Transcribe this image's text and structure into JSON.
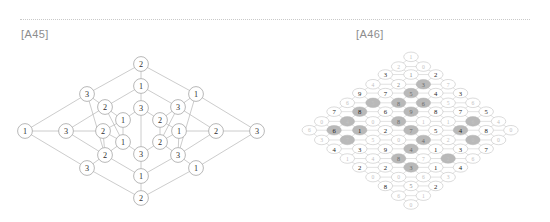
{
  "page": {
    "background": "#ffffff",
    "width": 550,
    "height": 222,
    "rule_style": "dotted",
    "rule_color": "#c9c9c9"
  },
  "captions": {
    "left": "[A45]",
    "right": "[A46]",
    "color": "#8d8d8d"
  },
  "figures": [
    {
      "id": "A45",
      "caption": "[A45]",
      "type": "node-link-diagram",
      "description": "sparse diamond lattice of circled digits",
      "node_fill": "#ffffff",
      "node_stroke": "#9a9a9a",
      "edge_color": "#b0b0b0",
      "node_count": 29,
      "value_set": [
        1,
        2,
        3
      ],
      "nodes": [
        {
          "id": "n0",
          "x": 131,
          "y": 14,
          "label": "2"
        },
        {
          "id": "n1",
          "x": 131,
          "y": 36,
          "label": "1"
        },
        {
          "id": "n2",
          "x": 131,
          "y": 58,
          "label": "3"
        },
        {
          "id": "n3",
          "x": 131,
          "y": 104,
          "label": "3"
        },
        {
          "id": "n4",
          "x": 131,
          "y": 126,
          "label": "1"
        },
        {
          "id": "n5",
          "x": 131,
          "y": 148,
          "label": "2"
        },
        {
          "id": "n6",
          "x": 77,
          "y": 44,
          "label": "3"
        },
        {
          "id": "n7",
          "x": 95,
          "y": 57,
          "label": "2"
        },
        {
          "id": "n8",
          "x": 113,
          "y": 70,
          "label": "1"
        },
        {
          "id": "n9",
          "x": 186,
          "y": 44,
          "label": "1"
        },
        {
          "id": "n10",
          "x": 168,
          "y": 57,
          "label": "3"
        },
        {
          "id": "n11",
          "x": 150,
          "y": 70,
          "label": "2"
        },
        {
          "id": "n12",
          "x": 77,
          "y": 118,
          "label": "3"
        },
        {
          "id": "n13",
          "x": 95,
          "y": 105,
          "label": "2"
        },
        {
          "id": "n14",
          "x": 113,
          "y": 92,
          "label": "1"
        },
        {
          "id": "n15",
          "x": 186,
          "y": 118,
          "label": "1"
        },
        {
          "id": "n16",
          "x": 168,
          "y": 105,
          "label": "3"
        },
        {
          "id": "n17",
          "x": 150,
          "y": 92,
          "label": "2"
        },
        {
          "id": "n18",
          "x": 15,
          "y": 81,
          "label": "1"
        },
        {
          "id": "n19",
          "x": 56,
          "y": 81,
          "label": "3"
        },
        {
          "id": "n20",
          "x": 93,
          "y": 81,
          "label": "2"
        },
        {
          "id": "n21",
          "x": 169,
          "y": 81,
          "label": "1"
        },
        {
          "id": "n22",
          "x": 206,
          "y": 81,
          "label": "2"
        },
        {
          "id": "n23",
          "x": 247,
          "y": 81,
          "label": "3"
        }
      ]
    },
    {
      "id": "A46",
      "caption": "[A46]",
      "type": "node-link-diagram",
      "description": "dense diamond lattice of circled digits 0-9 with shaded diagonal cells",
      "cell_fill_plain": "#ffffff",
      "cell_fill_shaded": "#b9b9b9",
      "cell_stroke": "#b5b5b5",
      "edge_color": "#bdbdbd",
      "value_set": [
        0,
        1,
        2,
        3,
        4,
        5,
        6,
        7,
        8,
        9
      ],
      "rows": [
        {
          "y": 10,
          "cells": [
            {
              "x": 139,
              "v": "1",
              "tone": "faint",
              "shade": false
            }
          ]
        },
        {
          "y": 21,
          "cells": [
            {
              "x": 125,
              "v": "2",
              "tone": "faint",
              "shade": false
            },
            {
              "x": 153,
              "v": "0",
              "tone": "faint",
              "shade": false
            }
          ]
        },
        {
          "y": 30,
          "cells": [
            {
              "x": 110,
              "v": "3",
              "tone": "dark",
              "shade": false
            },
            {
              "x": 139,
              "v": "1",
              "tone": "mid",
              "shade": false
            },
            {
              "x": 167,
              "v": "2",
              "tone": "dark",
              "shade": false
            }
          ]
        },
        {
          "y": 41,
          "cells": [
            {
              "x": 96,
              "v": "4",
              "tone": "faint",
              "shade": false
            },
            {
              "x": 125,
              "v": "2",
              "tone": "mid",
              "shade": false
            },
            {
              "x": 153,
              "v": "3",
              "tone": "onshade",
              "shade": true
            },
            {
              "x": 181,
              "v": "7",
              "tone": "faint",
              "shade": false
            }
          ]
        },
        {
          "y": 51,
          "cells": [
            {
              "x": 81,
              "v": "9",
              "tone": "dark",
              "shade": false
            },
            {
              "x": 110,
              "v": "7",
              "tone": "dark",
              "shade": false
            },
            {
              "x": 139,
              "v": "5",
              "tone": "onshade",
              "shade": true
            },
            {
              "x": 167,
              "v": "4",
              "tone": "dark",
              "shade": false
            },
            {
              "x": 195,
              "v": "3",
              "tone": "dark",
              "shade": false
            }
          ]
        },
        {
          "y": 62,
          "cells": [
            {
              "x": 67,
              "v": "6",
              "tone": "faint",
              "shade": false
            },
            {
              "x": 96,
              "v": "5",
              "tone": "faint",
              "shade": true
            },
            {
              "x": 125,
              "v": "8",
              "tone": "onshade",
              "shade": true
            },
            {
              "x": 153,
              "v": "6",
              "tone": "onshade",
              "shade": true
            },
            {
              "x": 181,
              "v": "5",
              "tone": "faint",
              "shade": false
            },
            {
              "x": 209,
              "v": "6",
              "tone": "faint",
              "shade": false
            }
          ]
        },
        {
          "y": 72,
          "cells": [
            {
              "x": 52,
              "v": "7",
              "tone": "dark",
              "shade": false
            },
            {
              "x": 81,
              "v": "8",
              "tone": "dark",
              "shade": true
            },
            {
              "x": 110,
              "v": "6",
              "tone": "dark",
              "shade": false
            },
            {
              "x": 139,
              "v": "9",
              "tone": "onshade",
              "shade": true
            },
            {
              "x": 167,
              "v": "8",
              "tone": "dark",
              "shade": false
            },
            {
              "x": 195,
              "v": "7",
              "tone": "dark",
              "shade": false
            },
            {
              "x": 224,
              "v": "5",
              "tone": "dark",
              "shade": false
            }
          ]
        },
        {
          "y": 83,
          "cells": [
            {
              "x": 38,
              "v": "0",
              "tone": "faint",
              "shade": false
            },
            {
              "x": 67,
              "v": "4",
              "tone": "faint",
              "shade": true
            },
            {
              "x": 96,
              "v": "0",
              "tone": "faint",
              "shade": false
            },
            {
              "x": 125,
              "v": "8",
              "tone": "onshade",
              "shade": true
            },
            {
              "x": 153,
              "v": "1",
              "tone": "faint",
              "shade": false
            },
            {
              "x": 181,
              "v": "1",
              "tone": "faint",
              "shade": false
            },
            {
              "x": 209,
              "v": "6",
              "tone": "faint",
              "shade": true
            },
            {
              "x": 238,
              "v": "4",
              "tone": "faint",
              "shade": false
            }
          ]
        },
        {
          "y": 93,
          "cells": [
            {
              "x": 24,
              "v": "6",
              "tone": "faint",
              "shade": false
            },
            {
              "x": 52,
              "v": "6",
              "tone": "dark",
              "shade": true
            },
            {
              "x": 81,
              "v": "1",
              "tone": "dark",
              "shade": true
            },
            {
              "x": 110,
              "v": "2",
              "tone": "dark",
              "shade": false
            },
            {
              "x": 139,
              "v": "7",
              "tone": "onshade",
              "shade": true
            },
            {
              "x": 167,
              "v": "5",
              "tone": "dark",
              "shade": false
            },
            {
              "x": 195,
              "v": "4",
              "tone": "dark",
              "shade": true
            },
            {
              "x": 224,
              "v": "8",
              "tone": "dark",
              "shade": false
            },
            {
              "x": 252,
              "v": "0",
              "tone": "faint",
              "shade": false
            }
          ]
        },
        {
          "y": 104,
          "cells": [
            {
              "x": 38,
              "v": "3",
              "tone": "faint",
              "shade": false
            },
            {
              "x": 67,
              "v": "7",
              "tone": "faint",
              "shade": true
            },
            {
              "x": 96,
              "v": "5",
              "tone": "faint",
              "shade": false
            },
            {
              "x": 125,
              "v": "0",
              "tone": "faint",
              "shade": false
            },
            {
              "x": 153,
              "v": "4",
              "tone": "onshade",
              "shade": true
            },
            {
              "x": 181,
              "v": "2",
              "tone": "faint",
              "shade": false
            },
            {
              "x": 209,
              "v": "0",
              "tone": "faint",
              "shade": true
            },
            {
              "x": 238,
              "v": "0",
              "tone": "faint",
              "shade": false
            }
          ]
        },
        {
          "y": 114,
          "cells": [
            {
              "x": 52,
              "v": "4",
              "tone": "dark",
              "shade": false
            },
            {
              "x": 81,
              "v": "3",
              "tone": "dark",
              "shade": false
            },
            {
              "x": 110,
              "v": "9",
              "tone": "dark",
              "shade": false
            },
            {
              "x": 139,
              "v": "4",
              "tone": "onshade",
              "shade": true
            },
            {
              "x": 167,
              "v": "1",
              "tone": "dark",
              "shade": false
            },
            {
              "x": 195,
              "v": "3",
              "tone": "dark",
              "shade": false
            },
            {
              "x": 224,
              "v": "7",
              "tone": "dark",
              "shade": false
            }
          ]
        },
        {
          "y": 125,
          "cells": [
            {
              "x": 67,
              "v": "1",
              "tone": "faint",
              "shade": false
            },
            {
              "x": 96,
              "v": "4",
              "tone": "faint",
              "shade": false
            },
            {
              "x": 125,
              "v": "8",
              "tone": "onshade",
              "shade": true
            },
            {
              "x": 153,
              "v": "7",
              "tone": "faint",
              "shade": false
            },
            {
              "x": 181,
              "v": "2",
              "tone": "faint",
              "shade": true
            },
            {
              "x": 209,
              "v": "6",
              "tone": "faint",
              "shade": false
            }
          ]
        },
        {
          "y": 135,
          "cells": [
            {
              "x": 81,
              "v": "2",
              "tone": "dark",
              "shade": false
            },
            {
              "x": 110,
              "v": "2",
              "tone": "dark",
              "shade": false
            },
            {
              "x": 139,
              "v": "3",
              "tone": "onshade",
              "shade": true
            },
            {
              "x": 167,
              "v": "1",
              "tone": "dark",
              "shade": false
            },
            {
              "x": 195,
              "v": "4",
              "tone": "dark",
              "shade": false
            }
          ]
        },
        {
          "y": 146,
          "cells": [
            {
              "x": 96,
              "v": "0",
              "tone": "faint",
              "shade": false
            },
            {
              "x": 125,
              "v": "0",
              "tone": "faint",
              "shade": false
            },
            {
              "x": 153,
              "v": "6",
              "tone": "faint",
              "shade": false
            },
            {
              "x": 181,
              "v": "3",
              "tone": "faint",
              "shade": false
            }
          ]
        },
        {
          "y": 156,
          "cells": [
            {
              "x": 110,
              "v": "8",
              "tone": "dark",
              "shade": false
            },
            {
              "x": 139,
              "v": "5",
              "tone": "mid",
              "shade": false
            },
            {
              "x": 167,
              "v": "2",
              "tone": "dark",
              "shade": false
            }
          ]
        },
        {
          "y": 167,
          "cells": [
            {
              "x": 125,
              "v": "6",
              "tone": "faint",
              "shade": false
            },
            {
              "x": 153,
              "v": "1",
              "tone": "faint",
              "shade": false
            }
          ]
        },
        {
          "y": 177,
          "cells": [
            {
              "x": 139,
              "v": "0",
              "tone": "faint",
              "shade": false
            }
          ]
        }
      ]
    }
  ]
}
